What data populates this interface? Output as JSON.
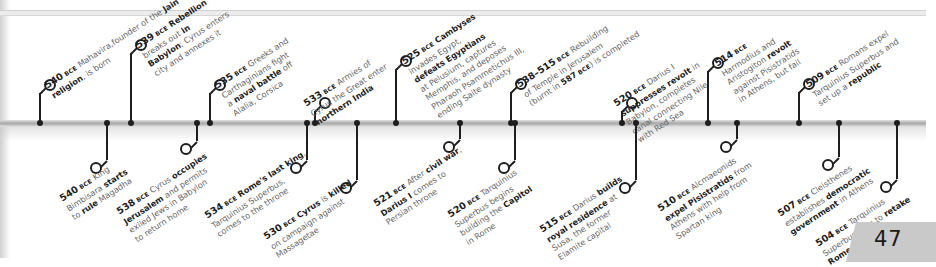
{
  "page": {
    "page_number": "47",
    "era_suffix": "BCE"
  },
  "timeline": {
    "above": [
      {
        "year": "540",
        "parts": [
          [
            "",
            " Mahavira,"
          ],
          [
            "",
            "founder of the "
          ],
          [
            "b",
            "Jain"
          ],
          [
            "br",
            ""
          ],
          [
            "b",
            "religion"
          ],
          [
            "",
            ", is born"
          ]
        ]
      },
      {
        "year": "539",
        "parts": [
          [
            "b",
            " Rebellion"
          ],
          [
            "br",
            ""
          ],
          [
            "",
            "breaks out "
          ],
          [
            "b",
            "in"
          ],
          [
            "br",
            ""
          ],
          [
            "b",
            "Babylon"
          ],
          [
            "",
            "; Cyrus enters"
          ],
          [
            "br",
            ""
          ],
          [
            "",
            "city and annexes it"
          ]
        ]
      },
      {
        "year": "535",
        "parts": [
          [
            "",
            " Greeks and"
          ],
          [
            "br",
            ""
          ],
          [
            "",
            "Carthaginians fight"
          ],
          [
            "br",
            ""
          ],
          [
            "",
            "a "
          ],
          [
            "b",
            "naval battle"
          ],
          [
            "",
            " off"
          ],
          [
            "br",
            ""
          ],
          [
            "",
            "Alalia, Corsica"
          ]
        ]
      },
      {
        "year": "533",
        "parts": [
          [
            "",
            " Armies of"
          ],
          [
            "br",
            ""
          ],
          [
            "",
            "Cyrus the Great enter"
          ],
          [
            "br",
            ""
          ],
          [
            "b",
            "northern India"
          ]
        ]
      },
      {
        "year": "525",
        "parts": [
          [
            "b",
            " Cambyses"
          ],
          [
            "br",
            ""
          ],
          [
            "",
            "invades Egypt,"
          ],
          [
            "br",
            ""
          ],
          [
            "b",
            "defeats Egyptians"
          ],
          [
            "br",
            ""
          ],
          [
            "",
            "at Pelusium, captures"
          ],
          [
            "br",
            ""
          ],
          [
            "",
            "Memphis, and deposes"
          ],
          [
            "br",
            ""
          ],
          [
            "",
            "Pharaoh Psammetichus III,"
          ],
          [
            "br",
            ""
          ],
          [
            "",
            "ending Saite dynasty"
          ]
        ]
      },
      {
        "year": "538–515",
        "parts": [
          [
            "",
            " Rebuilding"
          ],
          [
            "br",
            ""
          ],
          [
            "",
            "of Temple in Jerusalem"
          ],
          [
            "br",
            ""
          ],
          [
            "",
            "(burnt in "
          ],
          [
            "b",
            "587"
          ],
          [
            "era",
            " BCE"
          ],
          [
            "",
            ") is completed"
          ]
        ]
      },
      {
        "year": "520",
        "parts": [
          [
            "",
            " Darius I"
          ],
          [
            "br",
            ""
          ],
          [
            "b",
            "suppresses revolt"
          ],
          [
            "",
            " in"
          ],
          [
            "br",
            ""
          ],
          [
            "",
            "Babylon, completes"
          ],
          [
            "br",
            ""
          ],
          [
            "",
            "canal connecting Nile"
          ],
          [
            "br",
            ""
          ],
          [
            "",
            "with Red Sea"
          ]
        ]
      },
      {
        "year": "514",
        "parts": [
          [
            "br",
            ""
          ],
          [
            "",
            "Harmodius and"
          ],
          [
            "br",
            ""
          ],
          [
            "",
            "Aristogiton "
          ],
          [
            "b",
            "revolt"
          ],
          [
            "br",
            ""
          ],
          [
            "",
            "against Pisistratids"
          ],
          [
            "br",
            ""
          ],
          [
            "",
            "in Athens, but fail"
          ]
        ]
      },
      {
        "year": "509",
        "parts": [
          [
            "",
            " Romans expel"
          ],
          [
            "br",
            ""
          ],
          [
            "",
            "Tarquinius Superbus and"
          ],
          [
            "br",
            ""
          ],
          [
            "",
            "set up a "
          ],
          [
            "b",
            "republic"
          ]
        ]
      }
    ],
    "below": [
      {
        "year": "540",
        "parts": [
          [
            "",
            " King"
          ],
          [
            "br",
            ""
          ],
          [
            "",
            "Bimbisara "
          ],
          [
            "b",
            "starts"
          ],
          [
            "br",
            ""
          ],
          [
            "",
            "to "
          ],
          [
            "b",
            "rule"
          ],
          [
            "",
            " Magadha"
          ]
        ]
      },
      {
        "year": "538",
        "parts": [
          [
            "",
            " Cyrus "
          ],
          [
            "b",
            "occupies"
          ],
          [
            "br",
            ""
          ],
          [
            "b",
            "Jerusalem"
          ],
          [
            "",
            " and permits"
          ],
          [
            "br",
            ""
          ],
          [
            "",
            "exiled Jews in Babylon"
          ],
          [
            "br",
            ""
          ],
          [
            "",
            "to return home"
          ]
        ]
      },
      {
        "year": "534",
        "parts": [
          [
            "b",
            " Rome's last king"
          ],
          [
            "",
            ","
          ],
          [
            "br",
            ""
          ],
          [
            "",
            "Tarquinius Superbus,"
          ],
          [
            "br",
            ""
          ],
          [
            "",
            "comes to the throne"
          ]
        ]
      },
      {
        "year": "530",
        "parts": [
          [
            "b",
            " Cyrus"
          ],
          [
            "",
            " is "
          ],
          [
            "b",
            "killed"
          ],
          [
            "br",
            ""
          ],
          [
            "",
            "on campaign against"
          ],
          [
            "br",
            ""
          ],
          [
            "",
            "Massagetae"
          ]
        ]
      },
      {
        "year": "521",
        "parts": [
          [
            "",
            " After "
          ],
          [
            "b",
            "civil war"
          ],
          [
            "",
            ","
          ],
          [
            "br",
            ""
          ],
          [
            "b",
            "Darius I"
          ],
          [
            "",
            " comes to"
          ],
          [
            "br",
            ""
          ],
          [
            "",
            "Persian throne"
          ]
        ]
      },
      {
        "year": "520",
        "parts": [
          [
            "",
            " Tarquinius"
          ],
          [
            "br",
            ""
          ],
          [
            "",
            "Superbus begins"
          ],
          [
            "br",
            ""
          ],
          [
            "",
            "building the "
          ],
          [
            "b",
            "Capitol"
          ],
          [
            "br",
            ""
          ],
          [
            "",
            "in Rome"
          ]
        ]
      },
      {
        "year": "515",
        "parts": [
          [
            "",
            " Darius "
          ],
          [
            "b",
            "builds"
          ],
          [
            "br",
            ""
          ],
          [
            "b",
            "royal residence"
          ],
          [
            "",
            " at"
          ],
          [
            "br",
            ""
          ],
          [
            "",
            "Susa, the former"
          ],
          [
            "br",
            ""
          ],
          [
            "",
            "Elamite capital"
          ]
        ]
      },
      {
        "year": "510",
        "parts": [
          [
            "",
            " Alcmaeonids"
          ],
          [
            "br",
            ""
          ],
          [
            "b",
            "expel Pisistratids"
          ],
          [
            "",
            " from"
          ],
          [
            "br",
            ""
          ],
          [
            "",
            "Athens with help from"
          ],
          [
            "br",
            ""
          ],
          [
            "",
            "Spartan king"
          ]
        ]
      },
      {
        "year": "507",
        "parts": [
          [
            "",
            " Cleisthenes"
          ],
          [
            "br",
            ""
          ],
          [
            "",
            "establishes "
          ],
          [
            "b",
            "democratic"
          ],
          [
            "br",
            ""
          ],
          [
            "b",
            "government"
          ],
          [
            "",
            " in Athens"
          ]
        ]
      },
      {
        "year": "504",
        "parts": [
          [
            "",
            " Tarquinius"
          ],
          [
            "br",
            ""
          ],
          [
            "",
            "Superbus tries to "
          ],
          [
            "b",
            "retake"
          ],
          [
            "br",
            ""
          ],
          [
            "b",
            "Rome"
          ],
          [
            "",
            ", but fails"
          ]
        ]
      }
    ]
  },
  "layout": {
    "above": [
      {
        "x": 40,
        "ring_y": 83,
        "lx": 43,
        "ly": 82
      },
      {
        "x": 131,
        "ring_y": 43,
        "lx": 134,
        "ly": 42
      },
      {
        "x": 210,
        "ring_y": 83,
        "lx": 213,
        "ly": 82
      },
      {
        "x": 315,
        "ring_y": 101,
        "lx": 302,
        "ly": 100
      },
      {
        "x": 396,
        "ring_y": 59,
        "lx": 400,
        "ly": 58
      },
      {
        "x": 511,
        "ring_y": 82,
        "lx": 515,
        "ly": 81
      },
      {
        "x": 622,
        "ring_y": 101,
        "lx": 612,
        "ly": 100
      },
      {
        "x": 708,
        "ring_y": 61,
        "lx": 713,
        "ly": 60
      },
      {
        "x": 799,
        "ring_y": 82,
        "lx": 804,
        "ly": 81
      }
    ],
    "below": [
      {
        "x": 107,
        "ring_y": 166,
        "lx": 58,
        "ly": 195
      },
      {
        "x": 197,
        "ring_y": 147,
        "lx": 115,
        "ly": 208
      },
      {
        "x": 307,
        "ring_y": 166,
        "lx": 203,
        "ly": 212
      },
      {
        "x": 357,
        "ring_y": 186,
        "lx": 262,
        "ly": 233
      },
      {
        "x": 460,
        "ring_y": 145,
        "lx": 372,
        "ly": 200
      },
      {
        "x": 515,
        "ring_y": 166,
        "lx": 446,
        "ly": 211
      },
      {
        "x": 636,
        "ring_y": 186,
        "lx": 538,
        "ly": 226
      },
      {
        "x": 737,
        "ring_y": 145,
        "lx": 656,
        "ly": 205
      },
      {
        "x": 839,
        "ring_y": 163,
        "lx": 776,
        "ly": 210
      },
      {
        "x": 897,
        "ring_y": 185,
        "lx": 814,
        "ly": 240
      }
    ]
  }
}
